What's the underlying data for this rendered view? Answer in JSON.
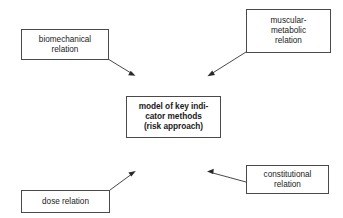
{
  "diagram": {
    "background_color": "#ffffff",
    "box_border_color": "#4a4a4a",
    "arrow_color": "#333333",
    "text_color": "#1a1a1a",
    "nodes": [
      {
        "id": "biomechanical",
        "label": "biomechanical\nrelation",
        "role": "input-factor",
        "position": "top-left",
        "bold": false
      },
      {
        "id": "muscular-metabolic",
        "label": "muscular-\nmetabolic\nrelation",
        "role": "input-factor",
        "position": "top-right",
        "bold": false
      },
      {
        "id": "model",
        "label": "model of key indi-\ncator  methods\n(risk approach)",
        "role": "central-concept",
        "position": "center",
        "bold": true
      },
      {
        "id": "dose",
        "label": "dose relation",
        "role": "input-factor",
        "position": "bottom-left",
        "bold": false
      },
      {
        "id": "constitutional",
        "label": "constitutional\nrelation",
        "role": "input-factor",
        "position": "bottom-right",
        "bold": false
      }
    ],
    "arrows": [
      {
        "id": "biomechanical-to-model",
        "from": "biomechanical",
        "to": "model",
        "direction": "down-right",
        "label": ""
      },
      {
        "id": "muscular-metabolic-to-model",
        "from": "muscular-metabolic",
        "to": "model",
        "direction": "down-left",
        "label": ""
      },
      {
        "id": "dose-to-model",
        "from": "dose",
        "to": "model",
        "direction": "up-right",
        "label": ""
      },
      {
        "id": "constitutional-to-model",
        "from": "constitutional",
        "to": "model",
        "direction": "up-left",
        "label": ""
      }
    ]
  }
}
